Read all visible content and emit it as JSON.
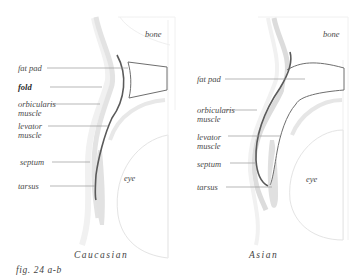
{
  "figure": {
    "number": "fig. 24 a-b",
    "panels": [
      {
        "id": "a",
        "caption": "Caucasian",
        "labels": {
          "bone": "bone",
          "fat_pad": "fat pad",
          "fold": "fold",
          "orbicularis_1": "orbicularis",
          "orbicularis_2": "muscle",
          "levator_1": "levator",
          "levator_2": "muscle",
          "septum": "septum",
          "tarsus": "tarsus",
          "eye": "eye"
        }
      },
      {
        "id": "b",
        "caption": "Asian",
        "labels": {
          "bone": "bone",
          "fat_pad": "fat pad",
          "orbicularis_1": "orbicularis",
          "orbicularis_2": "muscle",
          "levator_1": "levator",
          "levator_2": "muscle",
          "septum": "septum",
          "tarsus": "tarsus",
          "eye": "eye"
        }
      }
    ]
  },
  "colors": {
    "background": "#ffffff",
    "tissue_light": "#ececec",
    "tissue_mid": "#d9d9d9",
    "levator_line": "#5a5a5a",
    "outline": "#6e6e6e",
    "leader": "#9a9a9a"
  }
}
